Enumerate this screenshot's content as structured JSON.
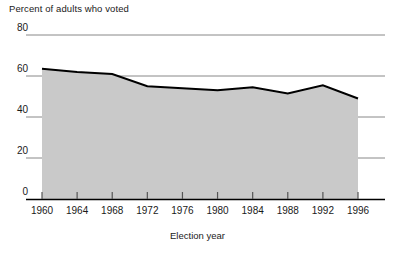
{
  "chart_data": {
    "type": "area",
    "title": "Percent of adults who voted",
    "xlabel": "Election year",
    "ylabel": "",
    "categories": [
      "1960",
      "1964",
      "1968",
      "1972",
      "1976",
      "1980",
      "1984",
      "1988",
      "1992",
      "1996"
    ],
    "x": [
      1960,
      1964,
      1968,
      1972,
      1976,
      1980,
      1984,
      1988,
      1992,
      1996
    ],
    "values": [
      63.5,
      62,
      61,
      55,
      54,
      53,
      54.5,
      51.5,
      55.5,
      49
    ],
    "series": [
      {
        "name": "Percent of adults who voted",
        "values": [
          63.5,
          62,
          61,
          55,
          54,
          53,
          54.5,
          51.5,
          55.5,
          49
        ]
      }
    ],
    "xlim": [
      1960,
      1996
    ],
    "ylim": [
      0,
      80
    ],
    "yticks": [
      0,
      20,
      40,
      60,
      80
    ],
    "ytick_labels": [
      "0",
      "20",
      "40",
      "60",
      "80"
    ],
    "xticks": [
      1960,
      1964,
      1968,
      1972,
      1976,
      1980,
      1984,
      1988,
      1992,
      1996
    ],
    "xtick_labels": [
      "1960",
      "1964",
      "1968",
      "1972",
      "1976",
      "1980",
      "1984",
      "1988",
      "1992",
      "1996"
    ],
    "grid": true,
    "grid_axis": "y",
    "legend": false,
    "legend_position": "none",
    "fill_color": "#c9c9c9",
    "line_color": "#000000",
    "grid_color": "#7a7a7a",
    "axis_color": "#000000",
    "text_color": "#1a1a1a"
  }
}
